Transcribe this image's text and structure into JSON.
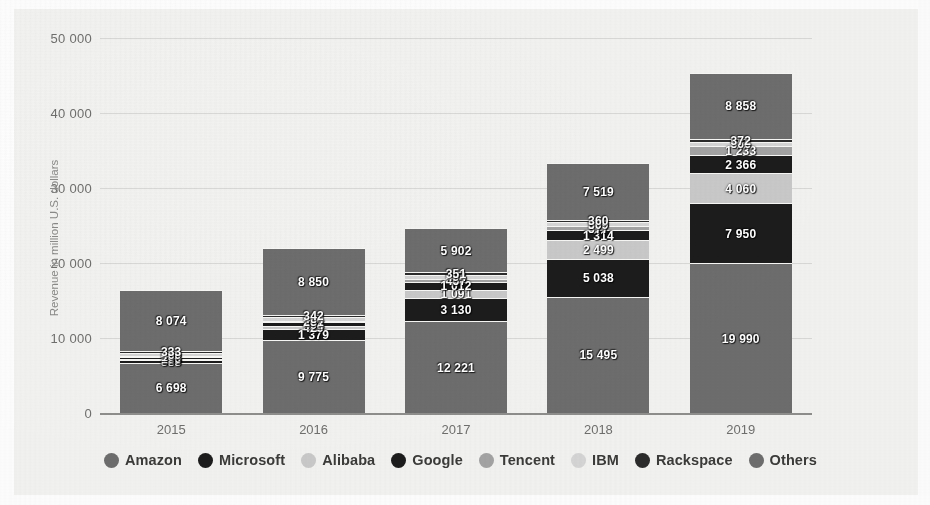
{
  "chart_data": {
    "type": "bar",
    "stacked": true,
    "title": "",
    "subtitle": "",
    "xlabel": "",
    "ylabel": "Revenue in million U.S. dollars",
    "categories": [
      "2015",
      "2016",
      "2017",
      "2018",
      "2019"
    ],
    "ylim": [
      0,
      50000
    ],
    "yticks": [
      0,
      10000,
      20000,
      30000,
      40000,
      50000
    ],
    "ytick_labels": [
      "0",
      "10 000",
      "20 000",
      "30 000",
      "40 000",
      "50 000"
    ],
    "grid": true,
    "legend_position": "bottom",
    "series": [
      {
        "name": "Amazon",
        "color": "#6d6d6d",
        "values": [
          6698,
          9775,
          12221,
          15495,
          19990
        ],
        "labels": [
          "6 698",
          "9 775",
          "12 221",
          "15 495",
          "19 990"
        ]
      },
      {
        "name": "Microsoft",
        "color": "#1c1c1c",
        "values": [
          383,
          1379,
          3130,
          5038,
          7950
        ],
        "labels": [
          "383",
          "1 379",
          "3 130",
          "5 038",
          "7 950"
        ]
      },
      {
        "name": "Alibaba",
        "color": "#c9c9c9",
        "values": [
          155,
          429,
          1091,
          2499,
          4060
        ],
        "labels": [
          "155",
          "429",
          "1 091",
          "2 499",
          "4 060"
        ]
      },
      {
        "name": "Google",
        "color": "#1c1c1c",
        "values": [
          196,
          494,
          1012,
          1314,
          2366
        ],
        "labels": [
          "196",
          "494",
          "1 012",
          "1 314",
          "2 366"
        ]
      },
      {
        "name": "Tencent",
        "color": "#a3a3a3",
        "values": [
          104,
          231,
          457,
          577,
          1233
        ],
        "labels": [
          "104",
          "231",
          "457",
          "577",
          "1 233"
        ]
      },
      {
        "name": "IBM",
        "color": "#d5d5d5",
        "values": [
          460,
          484,
          494,
          509,
          566
        ],
        "labels": [
          "460",
          "484",
          "494",
          "509",
          "566"
        ]
      },
      {
        "name": "Rackspace",
        "color": "#2b2b2b",
        "values": [
          333,
          342,
          351,
          360,
          372
        ],
        "labels": [
          "333",
          "342",
          "351",
          "360",
          "372"
        ]
      },
      {
        "name": "Others",
        "color": "#6d6d6d",
        "values": [
          8074,
          8850,
          5902,
          7519,
          8858
        ],
        "labels": [
          "8 074",
          "8 850",
          "5 902",
          "7 519",
          "8 858"
        ]
      }
    ],
    "totals": [
      16403,
      21984,
      24658,
      33311,
      45395
    ]
  },
  "colors": {
    "background": "#f2f2f0",
    "gridline": "#d8d8d6",
    "axis": "#8e8e8c",
    "tick_text": "#6f6f6e",
    "legend_text": "#3b3b3a",
    "label_text": "#ffffff"
  },
  "legend": {
    "items": [
      {
        "label": "Amazon",
        "color": "#6d6d6d"
      },
      {
        "label": "Microsoft",
        "color": "#1c1c1c"
      },
      {
        "label": "Alibaba",
        "color": "#c9c9c9"
      },
      {
        "label": "Google",
        "color": "#1c1c1c"
      },
      {
        "label": "Tencent",
        "color": "#a3a3a3"
      },
      {
        "label": "IBM",
        "color": "#d5d5d5"
      },
      {
        "label": "Rackspace",
        "color": "#2b2b2b"
      },
      {
        "label": "Others",
        "color": "#6d6d6d"
      }
    ]
  }
}
